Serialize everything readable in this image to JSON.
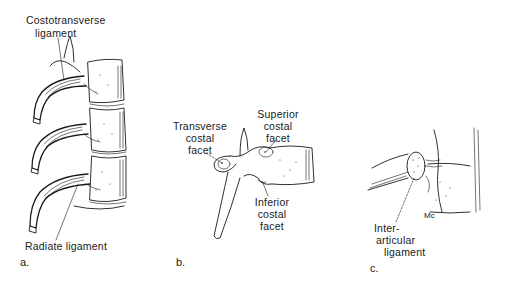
{
  "figure": {
    "panels": [
      {
        "id": "a",
        "letter": "a.",
        "labels": {
          "costotransverse_line1": "Costotransverse",
          "costotransverse_line2": "ligament",
          "radiate": "Radiate ligament"
        }
      },
      {
        "id": "b",
        "letter": "b.",
        "labels": {
          "transverse_line1": "Transverse",
          "transverse_line2": "costal",
          "transverse_line3": "facet",
          "superior_line1": "Superior",
          "superior_line2": "costal",
          "superior_line3": "facet",
          "inferior_line1": "Inferior",
          "inferior_line2": "costal",
          "inferior_line3": "facet"
        }
      },
      {
        "id": "c",
        "letter": "c.",
        "labels": {
          "interarticular_line1": "Inter-",
          "interarticular_line2": "articular",
          "interarticular_line3": "ligament",
          "mc_mark": "Mc"
        }
      }
    ],
    "colors": {
      "ink": "#1a1a1a",
      "background": "#ffffff"
    }
  }
}
